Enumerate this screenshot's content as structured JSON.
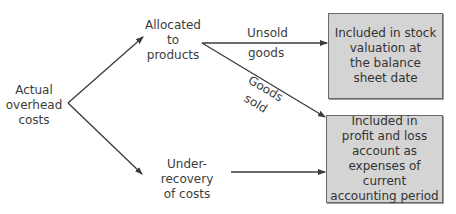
{
  "diagram": {
    "type": "flow",
    "nodes": {
      "actual_overhead": {
        "label": "Actual\noverhead\ncosts"
      },
      "allocated": {
        "label": "Allocated\nto\nproducts"
      },
      "under_recovery": {
        "label": "Under-recovery\nof costs"
      },
      "stock_valuation": {
        "label": "Included in stock\nvaluation at\nthe balance\nsheet date"
      },
      "profit_loss": {
        "label": "Included in\nprofit and loss\naccount as\nexpenses of current\naccounting period"
      }
    },
    "edges": [
      {
        "from": "actual_overhead",
        "to": "allocated",
        "label": ""
      },
      {
        "from": "actual_overhead",
        "to": "under_recovery",
        "label": ""
      },
      {
        "from": "allocated",
        "to": "stock_valuation",
        "label_line1": "Unsold",
        "label_line2": "goods"
      },
      {
        "from": "allocated",
        "to": "profit_loss",
        "label_line1": "Goods",
        "label_line2": "sold"
      },
      {
        "from": "under_recovery",
        "to": "profit_loss",
        "label": ""
      }
    ],
    "colors": {
      "box_fill": "#d4d4d4",
      "box_border": "#6a6a6a",
      "line": "#3a3a3a",
      "text": "#3c3c3c"
    }
  }
}
